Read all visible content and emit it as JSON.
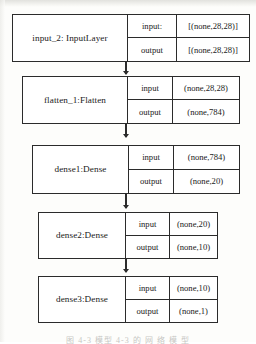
{
  "figure": {
    "kind": "neural-network-architecture-diagram",
    "caption": "图 4-3   模型 4-3  的 网 络 模 型",
    "ink_color": "#2b2b2b",
    "background_color": "#ffffff"
  },
  "columns": {
    "input_label": "input",
    "input_label_colon": "input:",
    "output_label": "output",
    "output_label_colon": "output"
  },
  "layers": [
    {
      "name": "input_2:  InputLayer",
      "input_label": "input:",
      "input_shape": "[(none,28,28)]",
      "output_label": "output",
      "output_shape": "[(none,28,28)]"
    },
    {
      "name": "flatten_1:Flatten",
      "input_label": "input",
      "input_shape": "(none,28,28)",
      "output_label": "output",
      "output_shape": "(none,784)"
    },
    {
      "name": "dense1:Dense",
      "input_label": "input",
      "input_shape": "(none,784)",
      "output_label": "output",
      "output_shape": "(none,20)"
    },
    {
      "name": "dense2:Dense",
      "input_label": "input",
      "input_shape": "(none,20)",
      "output_label": "output",
      "output_shape": "(none,10)"
    },
    {
      "name": "dense3:Dense",
      "input_label": "input",
      "input_shape": "(none,10)",
      "output_label": "output",
      "output_shape": "(none,1)"
    }
  ],
  "connections": [
    {
      "from": "input_2:  InputLayer",
      "to": "flatten_1:Flatten"
    },
    {
      "from": "flatten_1:Flatten",
      "to": "dense1:Dense"
    },
    {
      "from": "dense1:Dense",
      "to": "dense2:Dense"
    },
    {
      "from": "dense2:Dense",
      "to": "dense3:Dense"
    }
  ]
}
